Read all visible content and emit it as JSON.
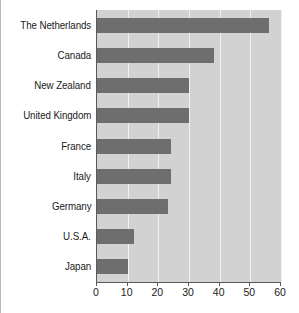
{
  "chart_data": {
    "type": "bar",
    "orientation": "horizontal",
    "title": "",
    "xlabel": "",
    "ylabel": "",
    "xlim": [
      0,
      60
    ],
    "xticks": [
      0,
      10,
      20,
      30,
      40,
      50,
      60
    ],
    "grid": true,
    "legend": false,
    "categories": [
      "The Netherlands",
      "Canada",
      "New Zealand",
      "United Kingdom",
      "France",
      "Italy",
      "Germany",
      "U.S.A.",
      "Japan"
    ],
    "values": [
      56,
      38,
      30,
      30,
      24,
      24,
      23,
      12,
      10
    ],
    "colors": {
      "bar": "#6e6e6e",
      "plot_background": "#d2d2d2",
      "gridline": "#f0f0f0",
      "axis": "#5a5a5a",
      "text": "#1a1a1a",
      "figure_background": "#ffffff"
    }
  }
}
